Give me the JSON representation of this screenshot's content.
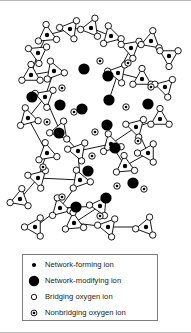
{
  "figure": {
    "background_color": "#ffffff",
    "ink_color": "#000000",
    "frame_color": "#b9b9b9"
  },
  "legend": {
    "border_color": "#7d7d7d",
    "items": [
      {
        "symbol": "network-forming-ion-symbol",
        "label": "Network-forming ion"
      },
      {
        "symbol": "network-modifying-ion-symbol",
        "label": "Network-modifying ion"
      },
      {
        "symbol": "bridging-oxygen-ion-symbol",
        "label": "Bridging oxygen ion"
      },
      {
        "symbol": "nonbridging-oxygen-ion-symbol",
        "label": "Nonbridging oxygen ion"
      }
    ]
  },
  "diagram_data": {
    "type": "diagram",
    "symbol_sizes": {
      "network_forming_r": 2.2,
      "network_modifying_r": 5.6,
      "bridging_oxygen_r": 3.2,
      "nonbridging_oxygen_outer_r": 3.2,
      "nonbridging_oxygen_inner_r": 1.3,
      "bond_width": 0.9
    },
    "triangles": [
      {
        "cx": 38,
        "cy": 52,
        "rot": 205
      },
      {
        "cx": 47,
        "cy": 34,
        "rot": 25
      },
      {
        "cx": 70,
        "cy": 28,
        "rot": 188
      },
      {
        "cx": 91,
        "cy": 27,
        "rot": 172
      },
      {
        "cx": 111,
        "cy": 35,
        "rot": 15
      },
      {
        "cx": 131,
        "cy": 47,
        "rot": 200
      },
      {
        "cx": 151,
        "cy": 40,
        "rot": 40
      },
      {
        "cx": 169,
        "cy": 55,
        "rot": 210
      },
      {
        "cx": 31,
        "cy": 74,
        "rot": 150
      },
      {
        "cx": 54,
        "cy": 70,
        "rot": 10
      },
      {
        "cx": 118,
        "cy": 72,
        "rot": 190
      },
      {
        "cx": 142,
        "cy": 78,
        "rot": 30
      },
      {
        "cx": 165,
        "cy": 86,
        "rot": 195
      },
      {
        "cx": 45,
        "cy": 96,
        "rot": 200
      },
      {
        "cx": 28,
        "cy": 117,
        "rot": 15
      },
      {
        "cx": 60,
        "cy": 130,
        "rot": 170
      },
      {
        "cx": 47,
        "cy": 152,
        "rot": 20
      },
      {
        "cx": 78,
        "cy": 150,
        "rot": 190
      },
      {
        "cx": 111,
        "cy": 143,
        "rot": 15
      },
      {
        "cx": 136,
        "cy": 126,
        "rot": 195
      },
      {
        "cx": 160,
        "cy": 118,
        "rot": 30
      },
      {
        "cx": 148,
        "cy": 152,
        "rot": 180
      },
      {
        "cx": 125,
        "cy": 165,
        "rot": 25
      },
      {
        "cx": 80,
        "cy": 179,
        "rot": 10
      },
      {
        "cx": 38,
        "cy": 177,
        "rot": 195
      },
      {
        "cx": 20,
        "cy": 198,
        "rot": 40
      },
      {
        "cx": 60,
        "cy": 207,
        "rot": 15
      },
      {
        "cx": 100,
        "cy": 205,
        "rot": 185
      },
      {
        "cx": 35,
        "cy": 226,
        "rot": 180
      },
      {
        "cx": 74,
        "cy": 222,
        "rot": 25
      },
      {
        "cx": 108,
        "cy": 226,
        "rot": 190
      },
      {
        "cx": 146,
        "cy": 226,
        "rot": 170
      }
    ],
    "modifier_ions": [
      {
        "cx": 108,
        "cy": 75
      },
      {
        "cx": 84,
        "cy": 68
      },
      {
        "cx": 109,
        "cy": 99
      },
      {
        "cx": 32,
        "cy": 96
      },
      {
        "cx": 60,
        "cy": 104
      },
      {
        "cx": 82,
        "cy": 108
      },
      {
        "cx": 107,
        "cy": 124
      },
      {
        "cx": 148,
        "cy": 103
      },
      {
        "cx": 59,
        "cy": 132
      },
      {
        "cx": 115,
        "cy": 147
      },
      {
        "cx": 88,
        "cy": 170
      },
      {
        "cx": 133,
        "cy": 182
      },
      {
        "cx": 106,
        "cy": 197
      },
      {
        "cx": 76,
        "cy": 206
      }
    ],
    "nonbridging_oxygens": [
      {
        "cx": 62,
        "cy": 87
      },
      {
        "cx": 100,
        "cy": 60
      },
      {
        "cx": 128,
        "cy": 62
      },
      {
        "cx": 74,
        "cy": 111
      },
      {
        "cx": 126,
        "cy": 106
      },
      {
        "cx": 151,
        "cy": 86
      },
      {
        "cx": 47,
        "cy": 121
      },
      {
        "cx": 95,
        "cy": 131
      },
      {
        "cx": 138,
        "cy": 140
      },
      {
        "cx": 92,
        "cy": 155
      },
      {
        "cx": 43,
        "cy": 166
      },
      {
        "cx": 117,
        "cy": 185
      },
      {
        "cx": 144,
        "cy": 188
      },
      {
        "cx": 62,
        "cy": 196
      },
      {
        "cx": 100,
        "cy": 215
      }
    ],
    "bridge_links": [
      [
        38,
        52,
        47,
        34
      ],
      [
        47,
        34,
        70,
        28
      ],
      [
        70,
        28,
        91,
        27
      ],
      [
        91,
        27,
        111,
        35
      ],
      [
        111,
        35,
        131,
        47
      ],
      [
        131,
        47,
        151,
        40
      ],
      [
        151,
        40,
        169,
        55
      ],
      [
        38,
        52,
        31,
        74
      ],
      [
        31,
        74,
        54,
        70
      ],
      [
        54,
        70,
        45,
        96
      ],
      [
        131,
        47,
        118,
        72
      ],
      [
        118,
        72,
        142,
        78
      ],
      [
        142,
        78,
        165,
        86
      ],
      [
        45,
        96,
        28,
        117
      ],
      [
        28,
        117,
        47,
        152
      ],
      [
        45,
        96,
        60,
        130
      ],
      [
        60,
        130,
        78,
        150
      ],
      [
        78,
        150,
        111,
        143
      ],
      [
        111,
        143,
        136,
        126
      ],
      [
        136,
        126,
        160,
        118
      ],
      [
        136,
        126,
        148,
        152
      ],
      [
        148,
        152,
        125,
        165
      ],
      [
        111,
        143,
        125,
        165
      ],
      [
        47,
        152,
        38,
        177
      ],
      [
        38,
        177,
        20,
        198
      ],
      [
        38,
        177,
        80,
        179
      ],
      [
        80,
        179,
        60,
        207
      ],
      [
        60,
        207,
        35,
        226
      ],
      [
        60,
        207,
        100,
        205
      ],
      [
        100,
        205,
        74,
        222
      ],
      [
        74,
        222,
        108,
        226
      ],
      [
        108,
        226,
        146,
        226
      ],
      [
        78,
        150,
        80,
        179
      ],
      [
        118,
        72,
        109,
        99
      ]
    ]
  }
}
